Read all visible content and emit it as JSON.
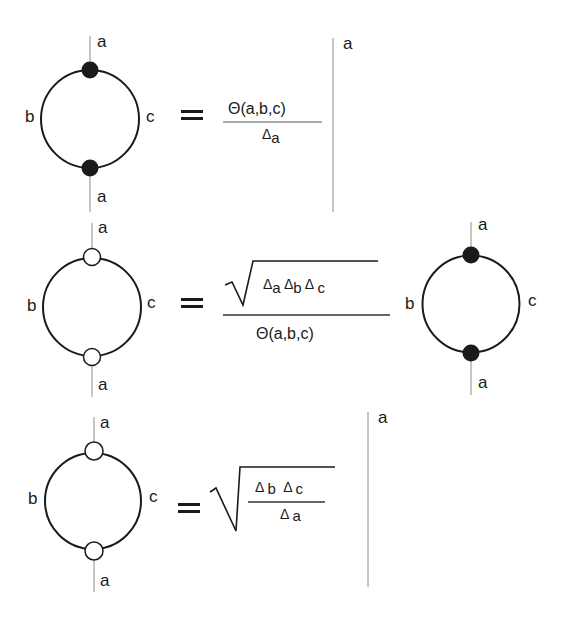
{
  "colors": {
    "ink": "#1a1a1a",
    "rule": "#8c8c8c",
    "background": "#ffffff"
  },
  "equations": [
    {
      "id": "eq1",
      "lhs": {
        "diagram": "loop",
        "node_style": "filled",
        "labels": {
          "top": "a",
          "bottom": "a",
          "left": "b",
          "right": "c"
        }
      },
      "relation": "=",
      "rhs": {
        "numerator": "Θ(a,b,c)",
        "denominator": {
          "delta": "Δ",
          "sub": "a"
        }
      },
      "evaluation_bar": {
        "label": "a"
      }
    },
    {
      "id": "eq2",
      "lhs": {
        "diagram": "loop",
        "node_style": "open",
        "labels": {
          "top": "a",
          "bottom": "a",
          "left": "b",
          "right": "c"
        }
      },
      "relation": "=",
      "rhs": {
        "numerator_sqrt": [
          {
            "delta": "Δ",
            "sub": "a"
          },
          {
            "delta": "Δ",
            "sub": "b"
          },
          {
            "delta": "Δ",
            "sub": "c"
          }
        ],
        "denominator": "Θ(a,b,c)",
        "times_diagram": {
          "diagram": "loop",
          "node_style": "filled",
          "labels": {
            "top": "a",
            "bottom": "a",
            "left": "b",
            "right": "c"
          }
        }
      }
    },
    {
      "id": "eq3",
      "lhs": {
        "diagram": "loop",
        "node_style": "open",
        "labels": {
          "top": "a",
          "bottom": "a",
          "left": "b",
          "right": "c"
        }
      },
      "relation": "=",
      "rhs": {
        "sqrt_fraction": {
          "numerator": [
            {
              "delta": "Δ",
              "sub": "b"
            },
            {
              "delta": "Δ",
              "sub": "c"
            }
          ],
          "denominator": {
            "delta": "Δ",
            "sub": "a"
          }
        }
      },
      "evaluation_bar": {
        "label": "a"
      }
    }
  ]
}
